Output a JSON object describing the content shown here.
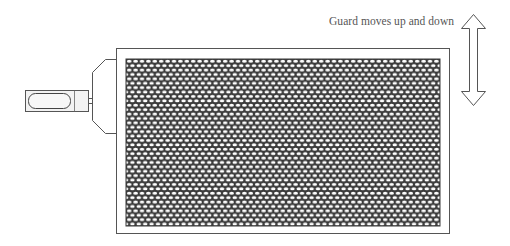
{
  "diagram": {
    "caption": "Guard moves up and down",
    "components": {
      "guard_frame": {
        "label": "Guard frame",
        "x": 116,
        "y": 48,
        "width": 334,
        "height": 186
      },
      "mesh_panel": {
        "label": "Perforated mesh panel",
        "x": 126,
        "y": 59,
        "width": 314,
        "height": 167,
        "pattern": "staggered oval perforations"
      },
      "mounting_bracket": {
        "label": "Mounting bracket"
      },
      "handle": {
        "label": "Handle"
      },
      "motion_arrow": {
        "label": "Double-headed vertical arrow",
        "direction": "up-down"
      }
    },
    "colors": {
      "line": "#555555",
      "mesh_web": "#3a3a3a",
      "mesh_hole": "#ffffff",
      "background": "#ffffff",
      "text": "#555555"
    }
  }
}
